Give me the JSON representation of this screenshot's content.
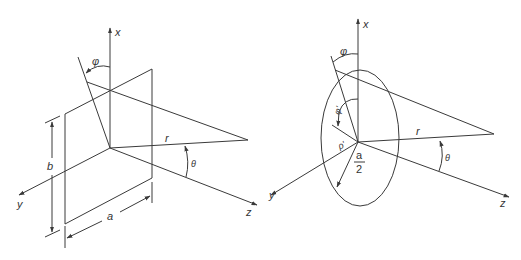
{
  "figure": {
    "left_panel": {
      "title": "Rectangular aperture",
      "axes": {
        "x": "x",
        "y": "y",
        "z": "z"
      },
      "labels": {
        "phi": "φ",
        "theta": "θ",
        "r": "r",
        "width": "a",
        "height": "b"
      }
    },
    "right_panel": {
      "title": "Circular aperture",
      "axes": {
        "x": "x",
        "y": "y",
        "z": "z"
      },
      "labels": {
        "phi": "φ",
        "phi_prime": "φ'",
        "rho_prime": "ρ'",
        "theta": "θ",
        "r": "r",
        "radius_num": "a",
        "radius_den": "2"
      }
    },
    "colors": {
      "line": "#3a3a3a",
      "background": "#ffffff"
    }
  }
}
